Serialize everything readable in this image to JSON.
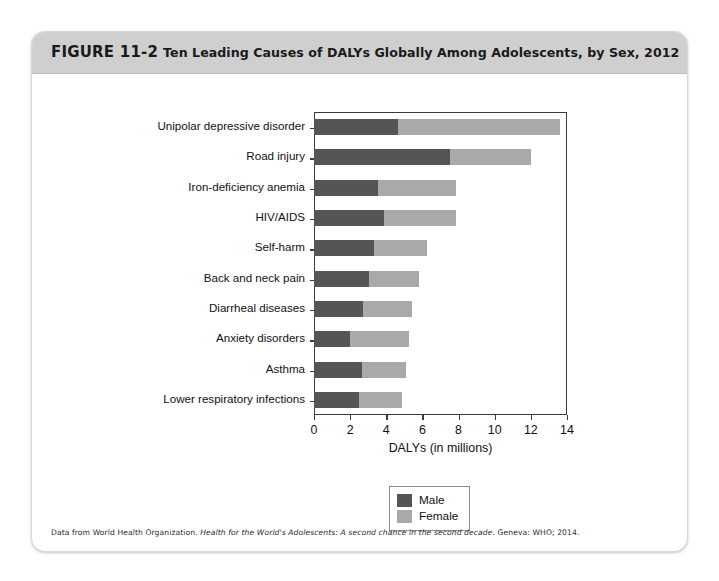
{
  "figure": {
    "number": "FIGURE 11-2",
    "title": "Ten Leading Causes of DALYs Globally Among Adolescents, by Sex, 2012",
    "source_prefix": "Data from World Health Organization. ",
    "source_italic": "Health for the World's Adolescents: A second chance in the second decade",
    "source_suffix": ". Geneva: WHO; 2014."
  },
  "colors": {
    "male": "#555555",
    "female": "#a9a9a9",
    "header_band": "#cfcfcf",
    "axis": "#3b3b3b",
    "page_background": "#ffffff"
  },
  "chart_data": {
    "type": "bar",
    "orientation": "horizontal",
    "stacked": true,
    "title": "Ten Leading Causes of DALYs Globally Among Adolescents, by Sex, 2012",
    "xlabel": "DALYs (in millions)",
    "ylabel": "",
    "xlim": [
      0,
      14
    ],
    "xticks": [
      0,
      2,
      4,
      6,
      8,
      10,
      12,
      14
    ],
    "xticklabels": [
      "0",
      "2",
      "4",
      "6",
      "8",
      "10",
      "12",
      "14"
    ],
    "grid": false,
    "legend_position": "below-axes-center",
    "categories": [
      "Unipolar depressive disorder",
      "Road injury",
      "Iron-deficiency anemia",
      "HIV/AIDS",
      "Self-harm",
      "Back and neck pain",
      "Diarrheal diseases",
      "Anxiety disorders",
      "Asthma",
      "Lower respiratory infections"
    ],
    "series": [
      {
        "name": "Male",
        "color": "#555555",
        "values": [
          4.65,
          7.5,
          3.55,
          3.9,
          3.3,
          3.05,
          2.7,
          2.0,
          2.65,
          2.5
        ]
      },
      {
        "name": "Female",
        "color": "#a9a9a9",
        "values": [
          8.95,
          4.5,
          4.3,
          3.95,
          2.95,
          2.75,
          2.75,
          3.25,
          2.45,
          2.35
        ]
      }
    ],
    "totals": [
      13.6,
      12.0,
      7.85,
      7.85,
      6.25,
      5.8,
      5.45,
      5.25,
      5.1,
      4.85
    ]
  },
  "legend": {
    "entries": [
      {
        "label": "Male",
        "color": "#555555"
      },
      {
        "label": "Female",
        "color": "#a9a9a9"
      }
    ]
  }
}
